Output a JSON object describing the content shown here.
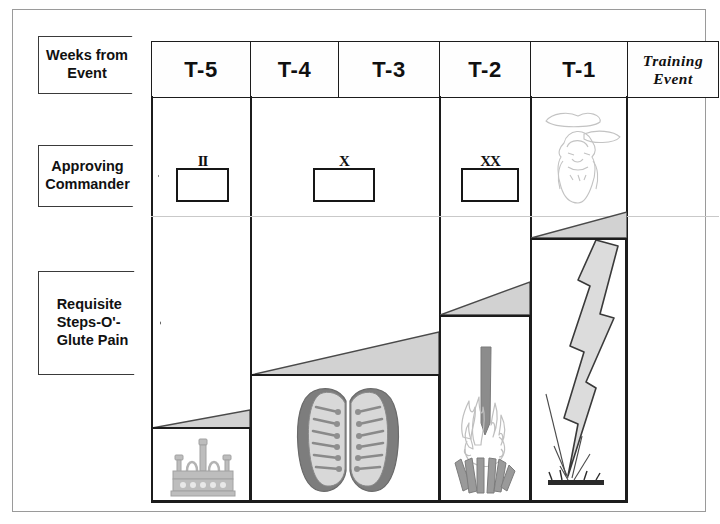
{
  "figure": {
    "type": "timeline-matrix-diagram",
    "row_labels": [
      {
        "id": "weeks-from-event",
        "text": "Weeks from\nEvent"
      },
      {
        "id": "approving-commander",
        "text": "Approving\nCommander"
      },
      {
        "id": "requisite-steps",
        "text": "Requisite\nSteps-O'-\nGlute Pain"
      }
    ],
    "columns": [
      {
        "id": "t5",
        "header": "T-5"
      },
      {
        "id": "t4",
        "header": "T-4"
      },
      {
        "id": "t3",
        "header": "T-3"
      },
      {
        "id": "t2",
        "header": "T-2"
      },
      {
        "id": "t1",
        "header": "T-1"
      },
      {
        "id": "training-event",
        "header": "Training\nEvent"
      }
    ],
    "approving_commander_marks": [
      {
        "column": "t5",
        "insignia": "II",
        "meaning": "captain-bars-icon"
      },
      {
        "column": "t4-t3",
        "insignia": "X",
        "meaning": "single-x-icon"
      },
      {
        "column": "t2",
        "insignia": "XX",
        "meaning": "double-x-icon"
      },
      {
        "column": "t1",
        "insignia": "",
        "meaning": "deity-in-clouds-sketch-icon"
      }
    ],
    "requisite_step_icons": [
      {
        "column": "t5",
        "icon": "candelabra-icon"
      },
      {
        "column": "t4",
        "icon": "boots-pair-icon"
      },
      {
        "column": "t2",
        "icon": "campfire-icon"
      },
      {
        "column": "t1",
        "icon": "lightning-bolt-icon"
      }
    ],
    "colors": {
      "wedge_fill": "#d2d2d2",
      "wedge_stroke": "#4a4a4a",
      "grid_stroke": "#1c1c1c",
      "faint_divider": "#c9c9c9",
      "page_border": "#9a9a9a",
      "text": "#101010"
    }
  }
}
